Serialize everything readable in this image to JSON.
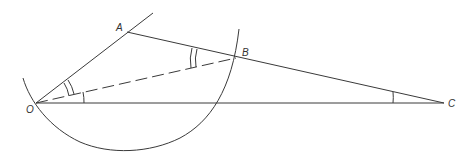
{
  "diagram": {
    "type": "geometry",
    "points": {
      "O": {
        "label": "O",
        "x": 36,
        "y": 103
      },
      "A": {
        "label": "A",
        "x": 127,
        "y": 32
      },
      "B": {
        "label": "B",
        "x": 236,
        "y": 58
      },
      "C": {
        "label": "C",
        "x": 444,
        "y": 103
      }
    },
    "segments": [
      {
        "from": "O",
        "to": "A",
        "extends_beyond": true,
        "style": "solid"
      },
      {
        "from": "A",
        "to": "C",
        "style": "solid"
      },
      {
        "from": "O",
        "to": "C",
        "style": "solid"
      },
      {
        "from": "O",
        "to": "B",
        "style": "dashed"
      }
    ],
    "angle_marks": [
      {
        "vertex": "O",
        "between": [
          "A",
          "B"
        ],
        "arcs": 2
      },
      {
        "vertex": "O",
        "between": [
          "B",
          "C"
        ],
        "arcs": 1
      },
      {
        "vertex": "B",
        "between": [
          "A",
          "O"
        ],
        "arcs": 2
      },
      {
        "vertex": "C",
        "between": [
          "A",
          "O"
        ],
        "arcs": 1
      }
    ],
    "arc": {
      "through": [
        "O",
        "B"
      ],
      "description": "circular arc centered near O-B region"
    }
  }
}
